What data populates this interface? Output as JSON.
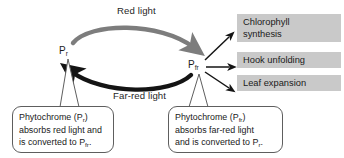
{
  "diagram": {
    "colors": {
      "red_light_arrow": "#808080",
      "far_red_light_arrow": "#111111",
      "response_box_fill": "#c9c9c9",
      "callout_border": "#5e5e5e",
      "background": "#ffffff",
      "text": "#1a1a1a"
    },
    "cycle": {
      "top_arrow_label": "Red light",
      "bottom_arrow_label": "Far-red light",
      "top_arrow_direction": "Pr to Pfr",
      "bottom_arrow_direction": "Pfr to Pr"
    },
    "states": {
      "left": {
        "symbol": "P",
        "subscript": "r"
      },
      "right": {
        "symbol": "P",
        "subscript": "fr"
      }
    },
    "responses": [
      {
        "id": "chlorophyll",
        "line1": "Chlorophyll",
        "line2": "synthesis"
      },
      {
        "id": "hook",
        "line1": "Hook unfolding",
        "line2": ""
      },
      {
        "id": "leaf",
        "line1": "Leaf expansion",
        "line2": ""
      }
    ],
    "callouts": {
      "left": {
        "line1_prefix": "Phytochrome (P",
        "line1_sub": "r",
        "line1_suffix": ")",
        "line2": "absorbs red light and",
        "line3_prefix": "is converted to P",
        "line3_sub": "fr",
        "line3_suffix": "."
      },
      "right": {
        "line1_prefix": "Phytochrome (P",
        "line1_sub": "fr",
        "line1_suffix": ")",
        "line2": "absorbs far-red light",
        "line3_prefix": "and is converted to P",
        "line3_sub": "r",
        "line3_suffix": "."
      }
    }
  }
}
